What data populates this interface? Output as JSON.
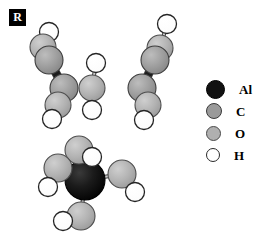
{
  "figure": {
    "panel_label": "R",
    "caption": "",
    "background_color": "#ffffff"
  },
  "legend": {
    "title": "",
    "items": [
      {
        "label": "Al",
        "symbol": "Al",
        "color": "#111111",
        "stroke": "#000000",
        "radius": 9.5,
        "icon": "atom-sphere-icon"
      },
      {
        "label": "C",
        "symbol": "C",
        "color": "#9a9a9a",
        "stroke": "#3a3a3a",
        "radius": 8.0,
        "icon": "atom-sphere-icon"
      },
      {
        "label": "O",
        "symbol": "O",
        "color": "#b0b0b0",
        "stroke": "#4a4a4a",
        "radius": 7.5,
        "icon": "atom-sphere-icon"
      },
      {
        "label": "H",
        "symbol": "H",
        "color": "#ffffff",
        "stroke": "#2a2a2a",
        "radius": 7.0,
        "icon": "atom-sphere-icon"
      }
    ]
  },
  "chart_data": {
    "type": "scatter",
    "title": "",
    "xlabel": "",
    "ylabel": "",
    "view_box": {
      "width": 276,
      "height": 241
    },
    "element_colors": {
      "Al": "#111111",
      "C": "#9a9a9a",
      "O": "#b0b0b0",
      "H": "#ffffff"
    },
    "element_radii": {
      "Al": 16,
      "C": 14,
      "O": 13,
      "H": 9.5
    },
    "fragments": [
      {
        "name": "left-chain",
        "formula": "HO-CH2-CH2-OH"
      },
      {
        "name": "center-fragment",
        "formula": "OH"
      },
      {
        "name": "right-chain",
        "formula": "HO-CH2-CH2-OH"
      },
      {
        "name": "aluminium-center",
        "formula": "Al(OH)4"
      }
    ],
    "atoms": [
      {
        "id": "L-H1",
        "element": "H",
        "x": 49,
        "y": 32,
        "r": 9.5,
        "fragment": "left-chain"
      },
      {
        "id": "L-O1",
        "element": "O",
        "x": 43,
        "y": 47,
        "r": 13,
        "fragment": "left-chain"
      },
      {
        "id": "L-C1",
        "element": "C",
        "x": 49,
        "y": 60,
        "r": 14,
        "fragment": "left-chain"
      },
      {
        "id": "L-C2",
        "element": "C",
        "x": 64,
        "y": 88,
        "r": 14,
        "fragment": "left-chain"
      },
      {
        "id": "L-O2",
        "element": "O",
        "x": 58,
        "y": 105,
        "r": 13,
        "fragment": "left-chain"
      },
      {
        "id": "L-H2",
        "element": "H",
        "x": 52,
        "y": 119,
        "r": 9.5,
        "fragment": "left-chain"
      },
      {
        "id": "M-H1",
        "element": "H",
        "x": 96,
        "y": 63,
        "r": 9.5,
        "fragment": "center-fragment"
      },
      {
        "id": "M-O1",
        "element": "O",
        "x": 92,
        "y": 88,
        "r": 13,
        "fragment": "center-fragment"
      },
      {
        "id": "M-H2",
        "element": "H",
        "x": 92,
        "y": 110,
        "r": 9.5,
        "fragment": "center-fragment"
      },
      {
        "id": "R-H1",
        "element": "H",
        "x": 167,
        "y": 24,
        "r": 9.5,
        "fragment": "right-chain"
      },
      {
        "id": "R-O1",
        "element": "O",
        "x": 160,
        "y": 48,
        "r": 13,
        "fragment": "right-chain"
      },
      {
        "id": "R-C1",
        "element": "C",
        "x": 155,
        "y": 60,
        "r": 14,
        "fragment": "right-chain"
      },
      {
        "id": "R-C2",
        "element": "C",
        "x": 142,
        "y": 88,
        "r": 14,
        "fragment": "right-chain"
      },
      {
        "id": "R-O2",
        "element": "O",
        "x": 148,
        "y": 105,
        "r": 13,
        "fragment": "right-chain"
      },
      {
        "id": "R-H2",
        "element": "H",
        "x": 144,
        "y": 120,
        "r": 9.5,
        "fragment": "right-chain"
      },
      {
        "id": "AL",
        "element": "Al",
        "x": 85,
        "y": 180,
        "r": 20,
        "fragment": "aluminium-center"
      },
      {
        "id": "A-O1",
        "element": "O",
        "x": 79,
        "y": 150,
        "r": 14,
        "fragment": "aluminium-center"
      },
      {
        "id": "A-H1",
        "element": "H",
        "x": 92,
        "y": 157,
        "r": 9.5,
        "fragment": "aluminium-center"
      },
      {
        "id": "A-O2",
        "element": "O",
        "x": 58,
        "y": 168,
        "r": 14,
        "fragment": "aluminium-center"
      },
      {
        "id": "A-H2",
        "element": "H",
        "x": 48,
        "y": 187,
        "r": 9.5,
        "fragment": "aluminium-center"
      },
      {
        "id": "A-O3",
        "element": "O",
        "x": 122,
        "y": 174,
        "r": 14,
        "fragment": "aluminium-center"
      },
      {
        "id": "A-H3",
        "element": "H",
        "x": 135,
        "y": 192,
        "r": 9.5,
        "fragment": "aluminium-center"
      },
      {
        "id": "A-O4",
        "element": "O",
        "x": 81,
        "y": 216,
        "r": 14,
        "fragment": "aluminium-center"
      },
      {
        "id": "A-H4",
        "element": "H",
        "x": 63,
        "y": 221,
        "r": 9.5,
        "fragment": "aluminium-center"
      }
    ],
    "bonds": [
      {
        "from": "L-H1",
        "to": "L-O1",
        "order": 1,
        "style": "thin"
      },
      {
        "from": "L-O1",
        "to": "L-C1",
        "order": 1,
        "style": "thin"
      },
      {
        "from": "L-C1",
        "to": "L-C2",
        "order": 1,
        "style": "thick"
      },
      {
        "from": "L-C2",
        "to": "L-O2",
        "order": 1,
        "style": "thin"
      },
      {
        "from": "L-O2",
        "to": "L-H2",
        "order": 1,
        "style": "thin"
      },
      {
        "from": "M-O1",
        "to": "M-H1",
        "order": 1,
        "style": "thin"
      },
      {
        "from": "M-O1",
        "to": "M-H2",
        "order": 1,
        "style": "thin"
      },
      {
        "from": "R-H1",
        "to": "R-O1",
        "order": 1,
        "style": "thin"
      },
      {
        "from": "R-O1",
        "to": "R-C1",
        "order": 1,
        "style": "thin"
      },
      {
        "from": "R-C1",
        "to": "R-C2",
        "order": 1,
        "style": "thick"
      },
      {
        "from": "R-C2",
        "to": "R-O2",
        "order": 1,
        "style": "thin"
      },
      {
        "from": "R-O2",
        "to": "R-H2",
        "order": 1,
        "style": "thin"
      },
      {
        "from": "AL",
        "to": "A-O1",
        "order": 1,
        "style": "thin"
      },
      {
        "from": "AL",
        "to": "A-O2",
        "order": 1,
        "style": "thin"
      },
      {
        "from": "AL",
        "to": "A-O3",
        "order": 1,
        "style": "thin"
      },
      {
        "from": "AL",
        "to": "A-O4",
        "order": 1,
        "style": "thin"
      },
      {
        "from": "A-O1",
        "to": "A-H1",
        "order": 1,
        "style": "thin"
      },
      {
        "from": "A-O2",
        "to": "A-H2",
        "order": 1,
        "style": "thin"
      },
      {
        "from": "A-O3",
        "to": "A-H3",
        "order": 1,
        "style": "thin"
      },
      {
        "from": "A-O4",
        "to": "A-H4",
        "order": 1,
        "style": "thin"
      }
    ]
  }
}
